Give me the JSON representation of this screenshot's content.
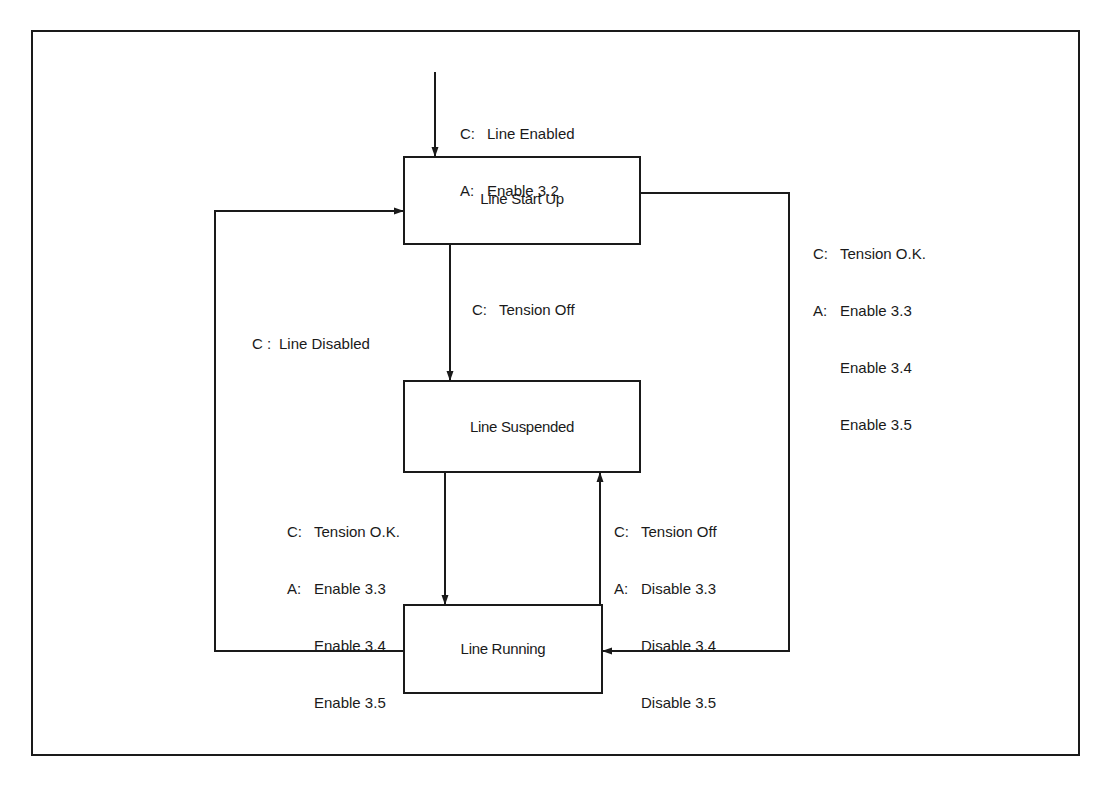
{
  "diagram": {
    "type": "state-transition",
    "states": [
      {
        "id": "start_up",
        "label": "Line Start Up"
      },
      {
        "id": "suspended",
        "label": "Line Suspended"
      },
      {
        "id": "running",
        "label": "Line Running"
      }
    ],
    "transitions": {
      "entry": {
        "to": "start_up",
        "condition_prefix": "C:",
        "condition": "Line Enabled",
        "action_prefix": "A:",
        "actions": [
          "Enable 3.2"
        ]
      },
      "start_to_suspended": {
        "from": "start_up",
        "to": "suspended",
        "condition_prefix": "C:",
        "condition": "Tension Off"
      },
      "start_to_running": {
        "from": "start_up",
        "to": "running",
        "condition_prefix": "C:",
        "condition": "Tension O.K.",
        "action_prefix": "A:",
        "actions": [
          "Enable 3.3",
          "Enable 3.4",
          "Enable 3.5"
        ]
      },
      "running_to_start": {
        "from": "running",
        "to": "start_up",
        "condition_prefix": "C :",
        "condition": "Line Disabled"
      },
      "suspended_to_running": {
        "from": "suspended",
        "to": "running",
        "condition_prefix": "C:",
        "condition": "Tension O.K.",
        "action_prefix": "A:",
        "actions": [
          "Enable 3.3",
          "Enable 3.4",
          "Enable 3.5"
        ]
      },
      "running_to_suspended": {
        "from": "running",
        "to": "suspended",
        "condition_prefix": "C:",
        "condition": "Tension Off",
        "action_prefix": "A:",
        "actions": [
          "Disable 3.3",
          "Disable 3.4",
          "Disable 3.5"
        ]
      }
    }
  }
}
